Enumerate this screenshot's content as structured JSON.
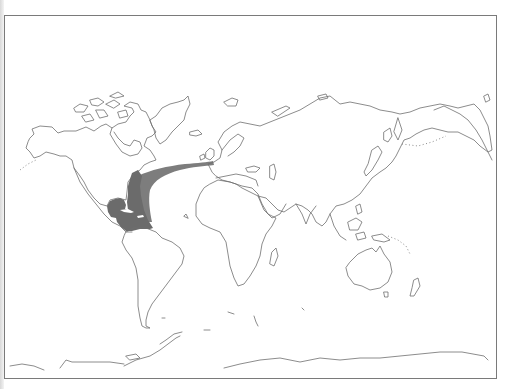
{
  "map": {
    "type": "world-outline-map",
    "projection": "equirectangular-like",
    "frame_color": "#7a7a7a",
    "coast_color": "#6e6e6e",
    "background": "#ffffff",
    "range_fill": "#6b6b6b",
    "range_band_fill": "#7d7d7d",
    "range_description": "Species range: western North Atlantic coast, Gulf of Mexico and Caribbean Sea, with a band extending across the North Atlantic to the British Isles / Bay of Biscay",
    "regions": [
      {
        "name": "north-america",
        "label": "North America"
      },
      {
        "name": "south-america",
        "label": "South America"
      },
      {
        "name": "greenland",
        "label": "Greenland"
      },
      {
        "name": "europe-asia",
        "label": "Eurasia"
      },
      {
        "name": "africa",
        "label": "Africa"
      },
      {
        "name": "australia",
        "label": "Australia"
      },
      {
        "name": "antarctica",
        "label": "Antarctica"
      }
    ],
    "distribution": [
      {
        "name": "gulf-caribbean-range",
        "label": "Gulf of Mexico & Caribbean"
      },
      {
        "name": "atlantic-band",
        "label": "North Atlantic band to Western Europe"
      }
    ]
  }
}
